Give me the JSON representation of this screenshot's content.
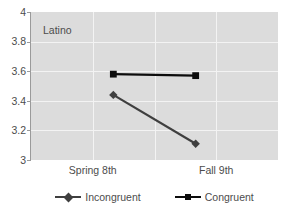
{
  "chart_data": {
    "type": "line",
    "title": "Latino",
    "xlabel": "",
    "ylabel": "",
    "categories": [
      "Spring 8th",
      "Fall 9th"
    ],
    "series": [
      {
        "name": "Incongruent",
        "values": [
          3.44,
          3.11
        ],
        "marker": "diamond",
        "color": "#3f3f3f"
      },
      {
        "name": "Congruent",
        "values": [
          3.58,
          3.57
        ],
        "marker": "square",
        "color": "#0d0d0d"
      }
    ],
    "ylim": [
      3,
      4
    ],
    "ytick_labels": [
      "4",
      "3.8",
      "3.6",
      "3.4",
      "3.2",
      "3"
    ],
    "ytick_values": [
      4,
      3.8,
      3.6,
      3.4,
      3.2,
      3
    ],
    "grid": true,
    "grid_color": "#f3f3f3",
    "plot_background": "#dcdcdc",
    "legend_position": "bottom"
  },
  "legend": {
    "items": [
      {
        "label": "Incongruent",
        "marker": "diamond-marker-icon"
      },
      {
        "label": "Congruent",
        "marker": "square-marker-icon"
      }
    ]
  },
  "axes": {
    "y_labels": [
      "4",
      "3.8",
      "3.6",
      "3.4",
      "3.2",
      "3"
    ],
    "x_labels": [
      "Spring 8th",
      "Fall 9th"
    ]
  },
  "annotations": {
    "group_label": "Latino"
  }
}
